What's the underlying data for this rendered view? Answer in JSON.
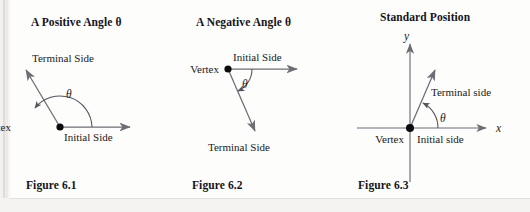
{
  "page": {
    "background": "#fdfdfc",
    "line_color": "#6e6c74",
    "text_color": "#15131a",
    "width": 530,
    "height": 212
  },
  "figures": [
    {
      "id": "figure-6-1",
      "title": "A Positive Angle θ",
      "caption": "Figure 6.1",
      "angle_symbol": "θ",
      "labels": {
        "terminal": "Terminal Side",
        "initial": "Initial Side",
        "vertex": "Vertex"
      },
      "geometry": {
        "vertex": [
          60,
          127
        ],
        "initial_ray_end": [
          136,
          127
        ],
        "terminal_ray_end": [
          21,
          66
        ],
        "terminal_angle_deg": 141,
        "arc_radius": 32,
        "arc_sweep": "counterclockwise"
      }
    },
    {
      "id": "figure-6-2",
      "title": "A Negative Angle θ",
      "caption": "Figure 6.2",
      "angle_symbol": "θ",
      "labels": {
        "terminal": "Terminal Side",
        "initial": "Initial Side",
        "vertex": "Vertex"
      },
      "geometry": {
        "vertex": [
          228,
          69
        ],
        "initial_ray_end": [
          303,
          69
        ],
        "terminal_ray_end": [
          259,
          136
        ],
        "terminal_angle_deg": -57,
        "arc_radius": 24,
        "arc_sweep": "clockwise"
      }
    },
    {
      "id": "figure-6-3",
      "title": "Standard Position",
      "caption": "Figure 6.3",
      "angle_symbol": "θ",
      "labels": {
        "terminal": "Terminal side",
        "initial": "Initial side",
        "vertex": "Vertex",
        "x_axis": "x",
        "y_axis": "y"
      },
      "geometry": {
        "origin": [
          410,
          128
        ],
        "x_axis": [
          357,
          128,
          492,
          128
        ],
        "y_axis": [
          410,
          38,
          410,
          182
        ],
        "terminal_ray_end": [
          439,
          64
        ],
        "terminal_angle_deg": 66,
        "arc_radius": 28,
        "arc_sweep": "counterclockwise"
      }
    }
  ]
}
